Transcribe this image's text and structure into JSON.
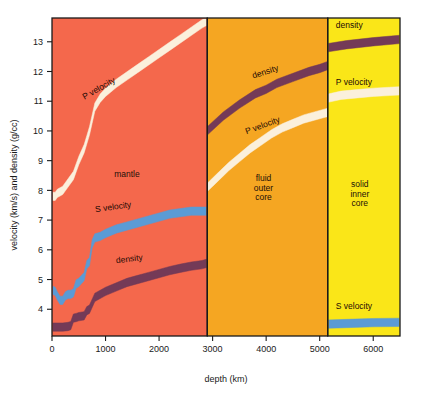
{
  "figure": {
    "title": "",
    "background_color": "#ffffff"
  },
  "axes": {
    "x": {
      "label": "depth (km)",
      "ticks": [
        0,
        1000,
        2000,
        3000,
        4000,
        5000,
        6000
      ],
      "tick_labels": [
        "0",
        "1000",
        "2000",
        "3000",
        "4000",
        "5000",
        "6000"
      ],
      "min": 0,
      "max": 6500
    },
    "y": {
      "label": "velocity (km/s) and density (g/cc)",
      "ticks": [
        4,
        5,
        6,
        7,
        8,
        9,
        10,
        11,
        12,
        13
      ],
      "tick_labels": [
        "4",
        "5",
        "6",
        "7",
        "8",
        "9",
        "10",
        "11",
        "12",
        "13"
      ],
      "min": 3.1,
      "max": 13.8
    }
  },
  "colors": {
    "mantle": "#f4684c",
    "outer_core": "#f5a622",
    "inner_core": "#fae618",
    "p_velocity": "#fbf0dc",
    "s_velocity": "#5b9bd5",
    "density": "#743a57",
    "frame": "#1a1a1a",
    "text": "#1a1a1a"
  },
  "regions": [
    {
      "name": "mantle",
      "label": "mantle",
      "label_lines": [
        "mantle"
      ],
      "x_start": 0,
      "x_end": 2900,
      "color_key": "mantle"
    },
    {
      "name": "fluid-outer-core",
      "label": "fluid outer core",
      "label_lines": [
        "fluid",
        "outer",
        "core"
      ],
      "x_start": 2900,
      "x_end": 5150,
      "color_key": "outer_core"
    },
    {
      "name": "solid-inner-core",
      "label": "solid inner core",
      "label_lines": [
        "solid",
        "inner",
        "core"
      ],
      "x_start": 5150,
      "x_end": 6500,
      "color_key": "inner_core"
    }
  ],
  "curve_labels": [
    {
      "name": "p-velocity-mantle",
      "text": "P velocity",
      "x": 900,
      "y": 11.35,
      "rotate": -30
    },
    {
      "name": "s-velocity-mantle",
      "text": "S velocity",
      "x": 1150,
      "y": 7.35,
      "rotate": -8
    },
    {
      "name": "density-mantle",
      "text": "density",
      "x": 1450,
      "y": 5.6,
      "rotate": -7
    },
    {
      "name": "density-outer-core",
      "text": "density",
      "x": 4000,
      "y": 11.9,
      "rotate": -18
    },
    {
      "name": "p-velocity-outer-core",
      "text": "P velocity",
      "x": 3950,
      "y": 10.1,
      "rotate": -20
    },
    {
      "name": "density-inner-core",
      "text": "density",
      "x": 5300,
      "y": 13.45,
      "rotate": 0
    },
    {
      "name": "p-velocity-inner-core",
      "text": "P velocity",
      "x": 5300,
      "y": 11.55,
      "rotate": 0
    },
    {
      "name": "s-velocity-inner-core",
      "text": "S velocity",
      "x": 5300,
      "y": 4.0,
      "rotate": 0
    }
  ],
  "chart_data": {
    "type": "area",
    "xlabel": "depth (km)",
    "ylabel": "velocity (km/s) and density (g/cc)",
    "xlim": [
      0,
      6500
    ],
    "ylim": [
      3.1,
      13.8
    ],
    "grid": false,
    "legend": "inline-curve-labels",
    "band_thickness_units": 0.28,
    "series": [
      {
        "name": "P velocity",
        "color": "#fbf0dc",
        "segments": [
          {
            "region": "mantle",
            "x": [
              0,
              60,
              100,
              200,
              300,
              400,
              450,
              500,
              600,
              650,
              700,
              750,
              800,
              900,
              1000,
              1200,
              1400,
              1600,
              1800,
              2000,
              2200,
              2400,
              2600,
              2800,
              2900
            ],
            "y": [
              7.8,
              7.8,
              7.9,
              8.0,
              8.25,
              8.5,
              8.75,
              9.0,
              9.4,
              9.7,
              10.0,
              10.4,
              10.8,
              11.1,
              11.3,
              11.6,
              11.85,
              12.1,
              12.35,
              12.6,
              12.85,
              13.1,
              13.35,
              13.6,
              13.7
            ]
          },
          {
            "region": "fluid outer core",
            "x": [
              2900,
              3100,
              3300,
              3500,
              3700,
              3900,
              4100,
              4300,
              4500,
              4700,
              4900,
              5100,
              5150
            ],
            "y": [
              8.1,
              8.45,
              8.8,
              9.1,
              9.4,
              9.65,
              9.9,
              10.1,
              10.25,
              10.4,
              10.5,
              10.6,
              10.62
            ]
          },
          {
            "region": "solid inner core",
            "x": [
              5150,
              5400,
              5700,
              6000,
              6300,
              6500
            ],
            "y": [
              11.1,
              11.2,
              11.25,
              11.3,
              11.33,
              11.35
            ]
          }
        ]
      },
      {
        "name": "S velocity",
        "color": "#5b9bd5",
        "segments": [
          {
            "region": "mantle",
            "x": [
              0,
              60,
              100,
              150,
              200,
              250,
              300,
              350,
              400,
              450,
              500,
              550,
              600,
              650,
              700,
              750,
              800,
              900,
              1000,
              1200,
              1400,
              1600,
              1800,
              2000,
              2200,
              2400,
              2600,
              2800,
              2900
            ],
            "y": [
              4.65,
              4.6,
              4.45,
              4.3,
              4.3,
              4.45,
              4.5,
              4.5,
              4.55,
              4.85,
              4.9,
              5.0,
              5.1,
              5.5,
              5.6,
              6.2,
              6.4,
              6.45,
              6.55,
              6.7,
              6.8,
              6.9,
              7.0,
              7.1,
              7.2,
              7.25,
              7.3,
              7.3,
              7.3
            ]
          },
          {
            "region": "solid inner core",
            "x": [
              5150,
              5500,
              6000,
              6500
            ],
            "y": [
              3.5,
              3.52,
              3.55,
              3.56
            ]
          }
        ]
      },
      {
        "name": "density",
        "color": "#743a57",
        "segments": [
          {
            "region": "mantle",
            "x": [
              0,
              100,
              200,
              300,
              350,
              400,
              450,
              500,
              600,
              650,
              700,
              750,
              800,
              900,
              1000,
              1200,
              1400,
              1600,
              1800,
              2000,
              2200,
              2400,
              2600,
              2800,
              2900
            ],
            "y": [
              3.4,
              3.4,
              3.4,
              3.42,
              3.45,
              3.7,
              3.72,
              3.75,
              3.78,
              3.95,
              4.0,
              4.2,
              4.4,
              4.5,
              4.6,
              4.75,
              4.9,
              5.0,
              5.1,
              5.2,
              5.3,
              5.38,
              5.45,
              5.5,
              5.55
            ]
          },
          {
            "region": "fluid outer core",
            "x": [
              2900,
              3200,
              3500,
              3800,
              4000,
              4200,
              4500,
              4800,
              5000,
              5150
            ],
            "y": [
              10.0,
              10.5,
              10.9,
              11.25,
              11.4,
              11.6,
              11.8,
              12.0,
              12.1,
              12.2
            ]
          },
          {
            "region": "solid inner core",
            "x": [
              5150,
              5500,
              6000,
              6500
            ],
            "y": [
              12.8,
              12.9,
              13.0,
              13.08
            ]
          }
        ]
      }
    ]
  }
}
